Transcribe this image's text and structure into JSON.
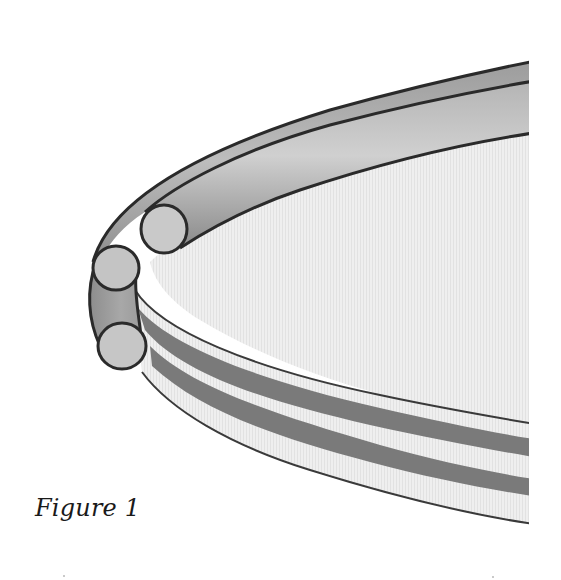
{
  "figure": {
    "caption": "Figure 1",
    "colors": {
      "background": "#ffffff",
      "interior_fill": "#ececec",
      "tube_light": "#cfcfcf",
      "tube_mid": "#a9a9a9",
      "tube_dark": "#8a8a8a",
      "band_light": "#d7d7d7",
      "band_stripe": "#7a7a7a",
      "outline": "#2a2a2a"
    },
    "parts": [
      {
        "name": "upper-tube",
        "label": "upper round tube"
      },
      {
        "name": "lower-tube",
        "label": "lower round tube"
      },
      {
        "name": "bottom-tube",
        "label": "bottom round tube"
      },
      {
        "name": "flat-band",
        "label": "flat striped band",
        "stripes": 2
      }
    ]
  }
}
